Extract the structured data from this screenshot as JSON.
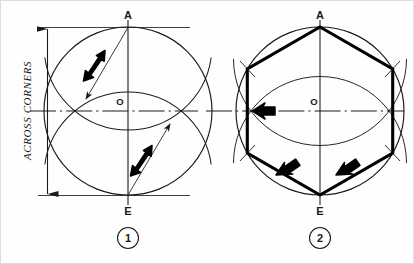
{
  "sheet": {
    "title": "Hexagon across corners construction",
    "background_color": "#fefefe",
    "ink_color": "#1a1a1a",
    "width": 414,
    "height": 264
  },
  "dimension": {
    "label": "ACROSS CORNERS",
    "orientation": "vertical-bottom-to-top",
    "arrow_style": "solid-filled-triangle-both-ends"
  },
  "figures": [
    {
      "number": "1",
      "caption": "1",
      "center_label": "O",
      "top_label": "A",
      "bottom_label": "E",
      "description": "Circle with vertical and horizontal centre lines; radius arcs struck from A and from E cutting the circumference",
      "circle": {
        "cx": 128,
        "cy": 111,
        "r": 84
      },
      "arcs": 2,
      "pointer_arrows": 2,
      "radius_lines": 2
    },
    {
      "number": "2",
      "caption": "2",
      "center_label": "O",
      "top_label": "A",
      "bottom_label": "E",
      "description": "Same circle with the six intersection points joined by straight lines to form the regular hexagon",
      "circle": {
        "cx": 320,
        "cy": 111,
        "r": 84
      },
      "arcs": 2,
      "pointer_arrows": 3,
      "hexagon_vertices": 6
    }
  ],
  "labels": {
    "a": "A",
    "o": "O",
    "e": "E",
    "fig_one": "1",
    "fig_two": "2"
  },
  "colors": {
    "ink": "#1a1a1a",
    "thin_line": "#2b2b2b",
    "paper": "#fefefe",
    "frame": "#d8d8d8"
  }
}
